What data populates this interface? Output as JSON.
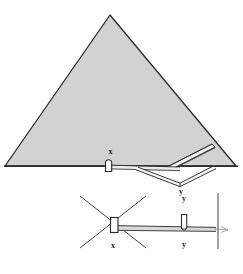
{
  "figure": {
    "background_color": "#ffffff",
    "ink_color": "#2b2b2b",
    "fill_color": "#d2d2d2",
    "fill_color_light": "#e8e8e8",
    "labels": {
      "section_entrance": "x",
      "section_exit": "y",
      "plan_entrance": "x",
      "plan_exit_upper": "y",
      "plan_exit_lower": "y"
    },
    "views": [
      {
        "name": "section-view",
        "kind": "elevation-section",
        "shape": "triangle",
        "apex": [
          110,
          15
        ],
        "base_left": [
          5,
          166
        ],
        "base_right": [
          236,
          166
        ],
        "baseline_y": 166
      },
      {
        "name": "plan-view",
        "kind": "plan",
        "axis_y": 228,
        "cross_center": [
          112,
          222
        ],
        "vertical_line_x": 218
      }
    ],
    "features": [
      {
        "name": "entrance-chamber-x",
        "view": "section-view",
        "x": 110,
        "y": 163
      },
      {
        "name": "descending-passage",
        "view": "section-view",
        "from": [
          113,
          166
        ],
        "to": [
          172,
          168
        ]
      },
      {
        "name": "lower-passage-v",
        "view": "section-view",
        "from": [
          150,
          170
        ],
        "to": [
          212,
          166
        ]
      },
      {
        "name": "upper-diagonal-passage",
        "view": "section-view",
        "from": [
          168,
          166
        ],
        "to": [
          213,
          145
        ]
      },
      {
        "name": "entrance-chamber-x",
        "view": "plan-view",
        "x": 113,
        "y": 222
      },
      {
        "name": "shaft-y",
        "view": "plan-view",
        "x": 184,
        "y": 220
      },
      {
        "name": "horizontal-passage",
        "view": "plan-view",
        "from": [
          118,
          228
        ],
        "to": [
          216,
          229
        ]
      }
    ]
  }
}
